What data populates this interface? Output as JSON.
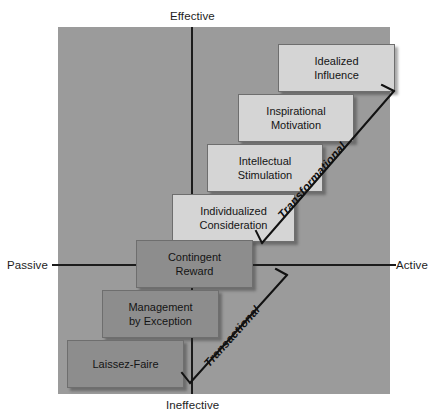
{
  "diagram": {
    "background_color": "#9b9b9b",
    "axes": {
      "vertical": {
        "top_label": "Effective",
        "bottom_label": "Ineffective"
      },
      "horizontal": {
        "left_label": "Passive",
        "right_label": "Active"
      }
    },
    "boxes": [
      {
        "id": "idealized-influence",
        "line1": "Idealized",
        "line2": "Influence",
        "style": "light"
      },
      {
        "id": "inspirational-motivation",
        "line1": "Inspirational",
        "line2": "Motivation",
        "style": "light"
      },
      {
        "id": "intellectual-stimulation",
        "line1": "Intellectual",
        "line2": "Stimulation",
        "style": "light"
      },
      {
        "id": "individualized-consideration",
        "line1": "Individualized",
        "line2": "Consideration",
        "style": "light"
      },
      {
        "id": "contingent-reward",
        "line1": "Contingent",
        "line2": "Reward",
        "style": "dark"
      },
      {
        "id": "management-by-exception",
        "line1": "Management",
        "line2": "by Exception",
        "style": "dark"
      },
      {
        "id": "laissez-faire",
        "line1": "Laissez-Faire",
        "line2": "",
        "style": "dark"
      }
    ],
    "brackets": [
      {
        "id": "transformational",
        "label": "Transformational"
      },
      {
        "id": "transactional",
        "label": "Transactional"
      }
    ]
  }
}
